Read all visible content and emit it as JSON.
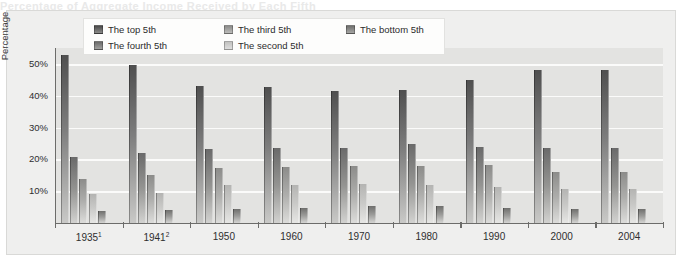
{
  "figure": {
    "cut_off_title": "Percentage of Aggregate Income Received by Each Fifth",
    "ylabel": "Percentage",
    "ytick_labels": [
      "50%",
      "40%",
      "30%",
      "20%",
      "10%"
    ],
    "xtick_labels": [
      "1935",
      "1941",
      "1950",
      "1960",
      "1970",
      "1980",
      "1990",
      "2000",
      "2004"
    ],
    "xtick_superscripts": [
      "1",
      "2",
      "",
      "",
      "",
      "",
      "",
      "",
      ""
    ]
  },
  "legend": {
    "items": [
      {
        "label": "The top 5th",
        "swatch": "legend-swatch-top-5th",
        "color": "#4f4f4f"
      },
      {
        "label": "The third 5th",
        "swatch": "legend-swatch-third-5th",
        "color": "#8c8c8a"
      },
      {
        "label": "The bottom 5th",
        "swatch": "legend-swatch-bottom-5th",
        "color": "#6f6f6d"
      },
      {
        "label": "The fourth 5th",
        "swatch": "legend-swatch-fourth-5th",
        "color": "#6a6a6a"
      },
      {
        "label": "The second 5th",
        "swatch": "legend-swatch-second-5th",
        "color": "#b4b4b2"
      }
    ]
  },
  "chart_data": {
    "type": "bar",
    "title": "Percentage of Aggregate Income Received by Each Fifth",
    "xlabel": "",
    "ylabel": "Percentage",
    "ylim": [
      0,
      55
    ],
    "yticks": [
      10,
      20,
      30,
      40,
      50
    ],
    "grid": true,
    "legend_position": "top-center",
    "categories": [
      "1935",
      "1941",
      "1950",
      "1960",
      "1970",
      "1980",
      "1990",
      "2000",
      "2004"
    ],
    "series": [
      {
        "name": "The top 5th",
        "values": [
          52.7,
          49.6,
          43.2,
          42.8,
          41.5,
          41.8,
          45.0,
          48.0,
          48.0
        ]
      },
      {
        "name": "The fourth 5th",
        "values": [
          20.7,
          22.0,
          23.4,
          23.7,
          23.6,
          24.7,
          24.0,
          23.7,
          23.7
        ]
      },
      {
        "name": "The third 5th",
        "values": [
          13.7,
          15.2,
          17.4,
          17.6,
          17.8,
          17.9,
          18.1,
          16.1,
          16.1
        ]
      },
      {
        "name": "The second 5th",
        "values": [
          9.2,
          9.5,
          12.0,
          11.9,
          12.4,
          11.8,
          11.2,
          10.6,
          10.8
        ]
      },
      {
        "name": "The bottom 5th",
        "values": [
          3.8,
          4.0,
          4.5,
          4.8,
          5.5,
          5.4,
          4.6,
          4.3,
          4.5
        ]
      }
    ]
  }
}
